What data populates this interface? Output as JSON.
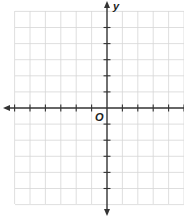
{
  "diagram": {
    "type": "coordinate-plane",
    "x_axis_label": "",
    "y_axis_label": "y",
    "origin_label": "O",
    "grid_color": "#d6d6d6",
    "axis_color": "#333333",
    "grid": {
      "left": 15,
      "top": 11,
      "right": 184,
      "bottom": 204,
      "origin_x": 107,
      "origin_y": 108,
      "spacing_x": 15.4,
      "spacing_y": 16.1,
      "cols_left_of_origin": 6,
      "cols_right_of_origin": 5,
      "rows_above_origin": 6,
      "rows_below_origin": 6
    }
  }
}
